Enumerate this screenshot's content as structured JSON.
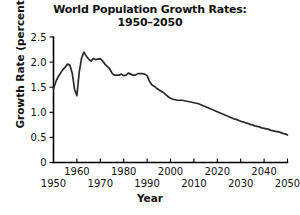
{
  "chart_data": {
    "type": "line",
    "title": "World Population Growth Rates: 1950–2050",
    "title_line1": "World Population Growth Rates:",
    "title_line2": "1950–2050",
    "xlabel": "Year",
    "ylabel": "Growth Rate (percent)",
    "xlim": [
      1950,
      2050
    ],
    "ylim": [
      0,
      2.5
    ],
    "grid": false,
    "legend": "none",
    "line_color": "#2b2b2b",
    "xticks": [
      1950,
      1960,
      1970,
      1980,
      1990,
      2000,
      2010,
      2020,
      2030,
      2040,
      2050
    ],
    "xtick_labels_upper": [
      "1960",
      "1980",
      "2000",
      "2020",
      "2040"
    ],
    "xtick_labels_lower": [
      "1950",
      "1970",
      "1990",
      "2010",
      "2030",
      "2050"
    ],
    "yticks": [
      0,
      0.5,
      1.0,
      1.5,
      2.0,
      2.5
    ],
    "ytick_labels": [
      "0",
      "0.5",
      "1.0",
      "1.5",
      "2.0",
      "2.5"
    ],
    "x": [
      1950,
      1951,
      1952,
      1953,
      1954,
      1955,
      1956,
      1957,
      1958,
      1959,
      1960,
      1961,
      1962,
      1963,
      1964,
      1965,
      1966,
      1967,
      1968,
      1969,
      1970,
      1971,
      1972,
      1973,
      1974,
      1975,
      1976,
      1977,
      1978,
      1979,
      1980,
      1981,
      1982,
      1983,
      1984,
      1985,
      1986,
      1987,
      1988,
      1989,
      1990,
      1991,
      1992,
      1993,
      1994,
      1995,
      1996,
      1997,
      1998,
      1999,
      2000,
      2001,
      2002,
      2003,
      2004,
      2005,
      2006,
      2007,
      2008,
      2009,
      2010,
      2011,
      2012,
      2013,
      2014,
      2015,
      2016,
      2017,
      2018,
      2019,
      2020,
      2021,
      2022,
      2023,
      2024,
      2025,
      2026,
      2027,
      2028,
      2029,
      2030,
      2031,
      2032,
      2033,
      2034,
      2035,
      2036,
      2037,
      2038,
      2039,
      2040,
      2041,
      2042,
      2043,
      2044,
      2045,
      2046,
      2047,
      2048,
      2049,
      2050
    ],
    "y": [
      1.47,
      1.61,
      1.71,
      1.78,
      1.85,
      1.9,
      1.96,
      1.94,
      1.78,
      1.46,
      1.33,
      1.8,
      2.08,
      2.2,
      2.12,
      2.06,
      2.02,
      2.07,
      2.05,
      2.06,
      2.07,
      2.02,
      1.96,
      1.91,
      1.87,
      1.78,
      1.74,
      1.74,
      1.74,
      1.76,
      1.73,
      1.74,
      1.78,
      1.76,
      1.74,
      1.74,
      1.77,
      1.77,
      1.77,
      1.76,
      1.73,
      1.62,
      1.55,
      1.52,
      1.48,
      1.45,
      1.42,
      1.39,
      1.35,
      1.31,
      1.28,
      1.26,
      1.25,
      1.24,
      1.24,
      1.24,
      1.23,
      1.22,
      1.21,
      1.2,
      1.19,
      1.18,
      1.17,
      1.15,
      1.13,
      1.11,
      1.09,
      1.07,
      1.05,
      1.03,
      1.01,
      0.99,
      0.97,
      0.95,
      0.93,
      0.91,
      0.89,
      0.87,
      0.86,
      0.84,
      0.82,
      0.81,
      0.79,
      0.78,
      0.76,
      0.75,
      0.73,
      0.72,
      0.71,
      0.69,
      0.68,
      0.67,
      0.66,
      0.64,
      0.63,
      0.62,
      0.61,
      0.6,
      0.58,
      0.57,
      0.55
    ]
  }
}
